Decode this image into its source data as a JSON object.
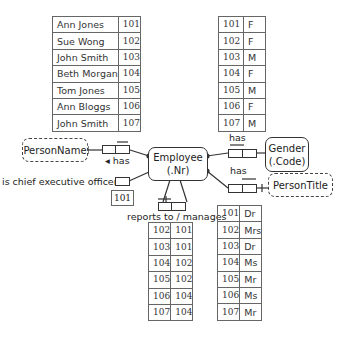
{
  "employee_names": {
    "columns": [
      "PersonName",
      "Employee"
    ],
    "rows": [
      [
        "Ann Jones",
        "101"
      ],
      [
        "Sue Wong",
        "102"
      ],
      [
        "John Smith",
        "103"
      ],
      [
        "Beth Morgan",
        "104"
      ],
      [
        "Tom Jones",
        "105"
      ],
      [
        "Ann Bloggs",
        "106"
      ],
      [
        "John Smith",
        "107"
      ]
    ]
  },
  "employee_genders": {
    "columns": [
      "Employee",
      "Gender"
    ],
    "rows": [
      [
        "101",
        "F"
      ],
      [
        "102",
        "F"
      ],
      [
        "103",
        "M"
      ],
      [
        "104",
        "F"
      ],
      [
        "105",
        "M"
      ],
      [
        "106",
        "F"
      ],
      [
        "107",
        "M"
      ]
    ]
  },
  "reports_to": {
    "columns": [
      "Employee",
      "Manager"
    ],
    "rows": [
      [
        "102",
        "101"
      ],
      [
        "103",
        "101"
      ],
      [
        "104",
        "102"
      ],
      [
        "105",
        "102"
      ],
      [
        "106",
        "104"
      ],
      [
        "107",
        "104"
      ]
    ]
  },
  "person_titles": {
    "columns": [
      "Employee",
      "PersonTitle"
    ],
    "rows": [
      [
        "101",
        "Dr"
      ],
      [
        "102",
        "Mrs"
      ],
      [
        "103",
        "Dr"
      ],
      [
        "104",
        "Ms"
      ],
      [
        "105",
        "Mr"
      ],
      [
        "106",
        "Ms"
      ],
      [
        "107",
        "Mr"
      ]
    ]
  },
  "entities": {
    "employee": {
      "name": "Employee",
      "ref": "(.Nr)"
    },
    "gender": {
      "name": "Gender",
      "ref": "(.Code)"
    }
  },
  "value_types": {
    "person_name": "PersonName",
    "person_title": "PersonTitle"
  },
  "fact_types": {
    "has_name": "◂ has",
    "has_gender": "has",
    "has_title": "has",
    "ceo": "is chief executive officer",
    "reports": "reports to / manages"
  },
  "ceo_instance": "101",
  "colors": {
    "line": "#333333",
    "table_border": "#666666",
    "background": "#ffffff"
  }
}
